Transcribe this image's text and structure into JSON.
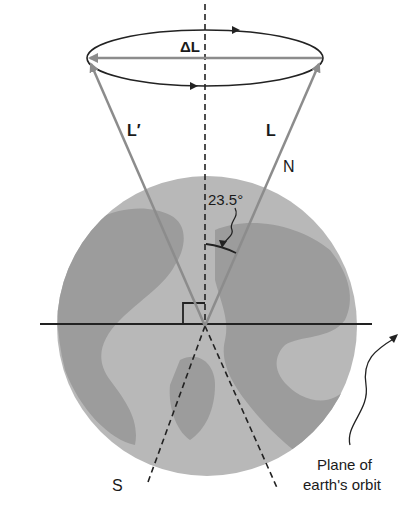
{
  "figure": {
    "labels": {
      "delta_l": "ΔL",
      "l_prime": "L′",
      "l": "L",
      "north": "N",
      "south": "S",
      "angle": "23.5°",
      "plane_line1": "Plane of",
      "plane_line2": "earth's orbit"
    },
    "colors": {
      "globe_ocean": "#b4b4b4",
      "globe_land": "#9a9a9a",
      "vector_gray": "#8c8c8c",
      "line_dark": "#222222",
      "background": "#ffffff"
    },
    "tilt_angle_deg": 23.5
  }
}
